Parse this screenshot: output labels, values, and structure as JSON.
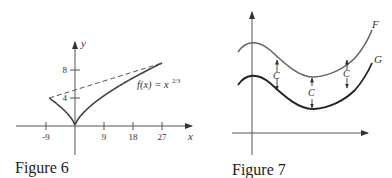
{
  "figures": [
    {
      "caption": "Figure 6",
      "x_axis_label": "x",
      "y_axis_label": "y",
      "x_ticks": [
        "-9",
        "9",
        "18",
        "27"
      ],
      "y_ticks": [
        "4",
        "8"
      ],
      "function_label": "f(x) = x",
      "function_exponent": "2/3",
      "chart_data": {
        "type": "line",
        "title": "",
        "xlabel": "x",
        "ylabel": "y",
        "x_tick_values": [
          -9,
          9,
          18,
          27
        ],
        "y_tick_values": [
          4,
          8
        ],
        "xlim": [
          -12,
          32
        ],
        "ylim": [
          -4,
          11
        ],
        "series": [
          {
            "name": "f(x) = x^(2/3)",
            "style": "solid",
            "domain": [
              -8,
              27
            ]
          },
          {
            "name": "secant",
            "style": "dashed",
            "points": [
              [
                -8,
                4
              ],
              [
                27,
                9
              ]
            ]
          }
        ]
      }
    },
    {
      "caption": "Figure 7",
      "curve_labels": [
        "F",
        "G"
      ],
      "offset_label": "C",
      "offset_label_count": 3
    }
  ]
}
